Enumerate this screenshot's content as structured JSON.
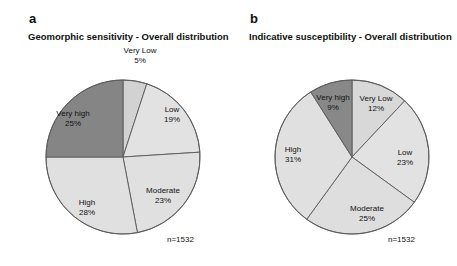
{
  "figure": {
    "background_color": "#ffffff",
    "slice_outline_color": "#595959",
    "text_color": "#111111"
  },
  "panels": [
    {
      "letter": "a",
      "title": "Geomorphic sensitivity - Overall distribution",
      "sample_size_label": "n=1532"
    },
    {
      "letter": "b",
      "title": "Indicative susceptibility - Overall distribution",
      "sample_size_label": "n=1532"
    }
  ],
  "chart_data": [
    {
      "type": "pie",
      "title": "Geomorphic sensitivity - Overall distribution",
      "panel": "a",
      "categories": [
        "Very Low",
        "Low",
        "Moderate",
        "High",
        "Very high"
      ],
      "values": [
        5,
        19,
        23,
        28,
        25
      ],
      "value_labels": [
        "5%",
        "19%",
        "23%",
        "28%",
        "25%"
      ],
      "units": "percent",
      "n": 1532,
      "n_label": "n=1532",
      "colors": [
        "#d2d2d2",
        "#e2e2e2",
        "#e0e0e0",
        "#e0e0e0",
        "#858585"
      ],
      "start_angle_deg": 0,
      "direction": "clockwise",
      "legend": "none",
      "labels_position": "inside-and-outside"
    },
    {
      "type": "pie",
      "title": "Indicative susceptibility - Overall distribution",
      "panel": "b",
      "categories": [
        "Very Low",
        "Low",
        "Moderate",
        "High",
        "Very high"
      ],
      "values": [
        12,
        23,
        25,
        31,
        9
      ],
      "value_labels": [
        "12%",
        "23%",
        "25%",
        "31%",
        "9%"
      ],
      "units": "percent",
      "n": 1532,
      "n_label": "n=1532",
      "colors": [
        "#d8d8d8",
        "#e2e2e2",
        "#dedede",
        "#e0e0e0",
        "#888888"
      ],
      "start_angle_deg": 0,
      "direction": "clockwise",
      "legend": "none",
      "labels_position": "inside"
    }
  ],
  "labels_a": [
    {
      "name": "Very Low",
      "value": "5%"
    },
    {
      "name": "Low",
      "value": "19%"
    },
    {
      "name": "Moderate",
      "value": "23%"
    },
    {
      "name": "High",
      "value": "28%"
    },
    {
      "name": "Very high",
      "value": "25%"
    }
  ],
  "labels_b": [
    {
      "name": "Very Low",
      "value": "12%"
    },
    {
      "name": "Low",
      "value": "23%"
    },
    {
      "name": "Moderate",
      "value": "25%"
    },
    {
      "name": "High",
      "value": "31%"
    },
    {
      "name": "Very high",
      "value": "9%"
    }
  ]
}
